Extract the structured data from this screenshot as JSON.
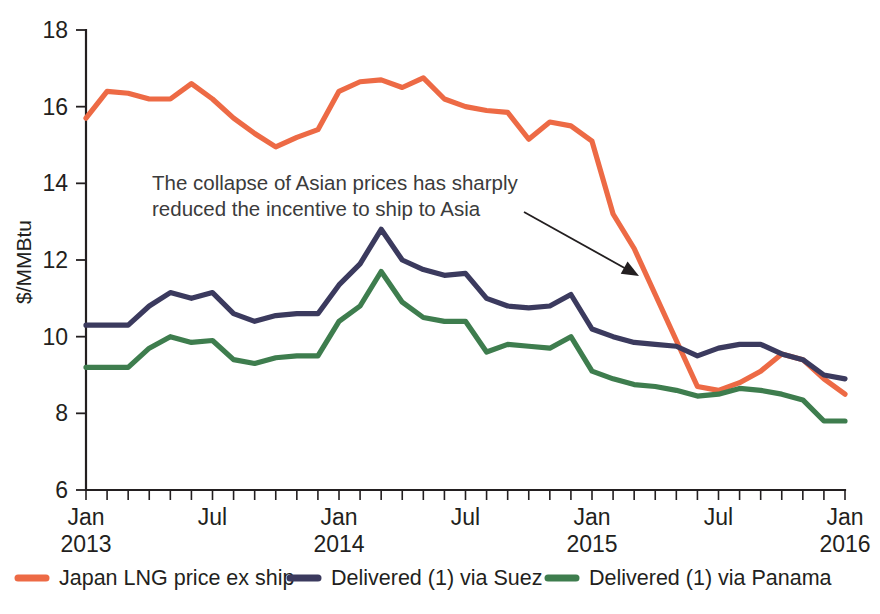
{
  "chart_data": {
    "type": "line",
    "title": "",
    "xlabel": "",
    "ylabel": "$/MMBtu",
    "ylim": [
      6,
      18
    ],
    "yticks": [
      6,
      8,
      10,
      12,
      14,
      16,
      18
    ],
    "grid": false,
    "legend_position": "bottom",
    "x_tick_labels": [
      {
        "line1": "Jan",
        "line2": "2013",
        "index": 0
      },
      {
        "line1": "Jul",
        "line2": "",
        "index": 6
      },
      {
        "line1": "Jan",
        "line2": "2014",
        "index": 12
      },
      {
        "line1": "Jul",
        "line2": "",
        "index": 18
      },
      {
        "line1": "Jan",
        "line2": "2015",
        "index": 24
      },
      {
        "line1": "Jul",
        "line2": "",
        "index": 30
      },
      {
        "line1": "Jan",
        "line2": "2016",
        "index": 36
      }
    ],
    "x": [
      "Jan 2013",
      "Feb 2013",
      "Mar 2013",
      "Apr 2013",
      "May 2013",
      "Jun 2013",
      "Jul 2013",
      "Aug 2013",
      "Sep 2013",
      "Oct 2013",
      "Nov 2013",
      "Dec 2013",
      "Jan 2014",
      "Feb 2014",
      "Mar 2014",
      "Apr 2014",
      "May 2014",
      "Jun 2014",
      "Jul 2014",
      "Aug 2014",
      "Sep 2014",
      "Oct 2014",
      "Nov 2014",
      "Dec 2014",
      "Jan 2015",
      "Feb 2015",
      "Mar 2015",
      "Apr 2015",
      "May 2015",
      "Jun 2015",
      "Jul 2015",
      "Aug 2015",
      "Sep 2015",
      "Oct 2015",
      "Nov 2015",
      "Dec 2015",
      "Jan 2016"
    ],
    "series": [
      {
        "name": "Japan LNG price ex ship",
        "color": "#ED6A45",
        "values": [
          15.7,
          16.4,
          16.35,
          16.2,
          16.2,
          16.6,
          16.2,
          15.7,
          15.3,
          14.95,
          15.2,
          15.4,
          16.4,
          16.65,
          16.7,
          16.5,
          16.75,
          16.2,
          16.0,
          15.9,
          15.85,
          15.15,
          15.6,
          15.5,
          15.1,
          13.2,
          12.3,
          11.1,
          9.9,
          8.7,
          8.6,
          8.8,
          9.1,
          9.55,
          9.4,
          8.9,
          8.5
        ]
      },
      {
        "name": "Delivered (1) via Suez",
        "color": "#3B3A5E",
        "values": [
          10.3,
          10.3,
          10.3,
          10.8,
          11.15,
          11.0,
          11.15,
          10.6,
          10.4,
          10.55,
          10.6,
          10.6,
          11.35,
          11.9,
          12.8,
          12.0,
          11.75,
          11.6,
          11.65,
          11.0,
          10.8,
          10.75,
          10.8,
          11.1,
          10.2,
          10.0,
          9.85,
          9.8,
          9.75,
          9.5,
          9.7,
          9.8,
          9.8,
          9.55,
          9.4,
          9.0,
          8.9
        ]
      },
      {
        "name": "Delivered (1) via Panama",
        "color": "#3E7D4E",
        "values": [
          9.2,
          9.2,
          9.2,
          9.7,
          10.0,
          9.85,
          9.9,
          9.4,
          9.3,
          9.45,
          9.5,
          9.5,
          10.4,
          10.8,
          11.7,
          10.9,
          10.5,
          10.4,
          10.4,
          9.6,
          9.8,
          9.75,
          9.7,
          10.0,
          9.1,
          8.9,
          8.75,
          8.7,
          8.6,
          8.45,
          8.5,
          8.65,
          8.6,
          8.5,
          8.35,
          7.8,
          7.8
        ]
      }
    ],
    "annotations": [
      {
        "id": "asia-collapse-note",
        "line1": "The collapse of Asian prices has sharply",
        "line2": "reduced the incentive to ship to Asia",
        "arrow": {
          "from_x": 524,
          "from_y": 212,
          "to_x": 639,
          "to_y": 276
        }
      }
    ]
  },
  "legend": {
    "items": [
      {
        "label": "Japan LNG price ex ship",
        "color": "#ED6A45"
      },
      {
        "label": "Delivered (1) via Suez",
        "color": "#3B3A5E"
      },
      {
        "label": "Delivered (1) via Panama",
        "color": "#3E7D4E"
      }
    ]
  },
  "colors": {
    "japan": "#ED6A45",
    "suez": "#3B3A5E",
    "panama": "#3E7D4E",
    "axis": "#231f20",
    "annotation_text": "#3b3b3b",
    "background": "#ffffff"
  }
}
